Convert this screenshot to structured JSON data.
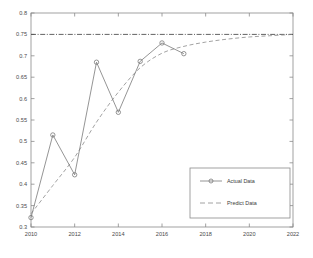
{
  "figure": {
    "background_color": "#ffffff",
    "axes_color": "#8a8a8a",
    "text_color": "#4a4a4a"
  },
  "chart_data": {
    "type": "line",
    "title": "",
    "xlabel": "",
    "ylabel": "",
    "xlim": [
      2010,
      2022
    ],
    "ylim": [
      0.3,
      0.8
    ],
    "xticks": [
      2010,
      2012,
      2014,
      2016,
      2018,
      2020,
      2022
    ],
    "xtick_labels": [
      "2010",
      "2012",
      "2014",
      "2016",
      "2018",
      "2020",
      "2022"
    ],
    "yticks": [
      0.3,
      0.35,
      0.4,
      0.45,
      0.5,
      0.55,
      0.6,
      0.65,
      0.7,
      0.75,
      0.8
    ],
    "ytick_labels": [
      "0.3",
      "0.35",
      "0.4",
      "0.45",
      "0.5",
      "0.55",
      "0.6",
      "0.65",
      "0.7",
      "0.75",
      "0.8"
    ],
    "grid": false,
    "legend_position": "lower-right",
    "reference_line": {
      "name": "saturation-line",
      "orientation": "horizontal",
      "y": 0.75,
      "style": "dash-dot",
      "color": "#3a3a3a"
    },
    "series": [
      {
        "name": "Actual Data",
        "style": "solid",
        "marker": "circle",
        "color": "#7a7a7a",
        "x": [
          2010,
          2011,
          2012,
          2013,
          2014,
          2015,
          2016,
          2017
        ],
        "values": [
          0.322,
          0.515,
          0.422,
          0.685,
          0.568,
          0.687,
          0.73,
          0.705
        ]
      },
      {
        "name": "Predict Data",
        "style": "dashed",
        "marker": "none",
        "color": "#8a8a8a",
        "x": [
          2010,
          2011,
          2012,
          2013,
          2014,
          2015,
          2016,
          2017,
          2018,
          2019,
          2020,
          2021,
          2022
        ],
        "values": [
          0.331,
          0.397,
          0.463,
          0.545,
          0.615,
          0.672,
          0.706,
          0.722,
          0.732,
          0.739,
          0.744,
          0.747,
          0.75
        ]
      }
    ]
  },
  "legend": {
    "entries": [
      {
        "label": "Actual Data",
        "style": "solid",
        "marker": "circle"
      },
      {
        "label": "Predict Data",
        "style": "dashed",
        "marker": "none"
      }
    ]
  }
}
